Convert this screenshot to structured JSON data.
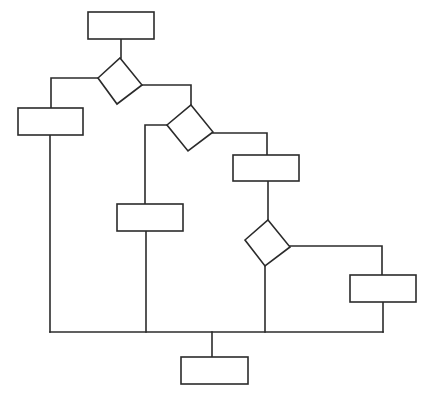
{
  "diagram": {
    "type": "flowchart",
    "background": "#ffffff",
    "stroke_color": "#2b2b2b",
    "nodes": [
      {
        "id": "start-process",
        "shape": "rect",
        "x": 88,
        "y": 12,
        "w": 66,
        "h": 27,
        "label": ""
      },
      {
        "id": "decision-1",
        "shape": "diamond",
        "points": [
          [
            120,
            58
          ],
          [
            142,
            85
          ],
          [
            117,
            104
          ],
          [
            98,
            78
          ]
        ],
        "label": ""
      },
      {
        "id": "process-left",
        "shape": "rect",
        "x": 18,
        "y": 108,
        "w": 65,
        "h": 27,
        "label": ""
      },
      {
        "id": "decision-2",
        "shape": "diamond",
        "points": [
          [
            191,
            105
          ],
          [
            213,
            132
          ],
          [
            188,
            151
          ],
          [
            167,
            125
          ]
        ],
        "label": ""
      },
      {
        "id": "process-middle",
        "shape": "rect",
        "x": 117,
        "y": 204,
        "w": 66,
        "h": 27,
        "label": ""
      },
      {
        "id": "process-right-upper",
        "shape": "rect",
        "x": 233,
        "y": 155,
        "w": 66,
        "h": 26,
        "label": ""
      },
      {
        "id": "decision-3",
        "shape": "diamond",
        "points": [
          [
            268,
            220
          ],
          [
            290,
            247
          ],
          [
            265,
            266
          ],
          [
            245,
            240
          ]
        ],
        "label": ""
      },
      {
        "id": "process-right",
        "shape": "rect",
        "x": 350,
        "y": 275,
        "w": 66,
        "h": 27,
        "label": ""
      },
      {
        "id": "end-process",
        "shape": "rect",
        "x": 181,
        "y": 357,
        "w": 67,
        "h": 27,
        "label": ""
      }
    ],
    "edges": [
      {
        "id": "start-to-decision-1",
        "points": [
          [
            121,
            39
          ],
          [
            121,
            58
          ]
        ]
      },
      {
        "id": "decision-1-to-left",
        "points": [
          [
            98,
            78
          ],
          [
            51,
            78
          ],
          [
            51,
            108
          ]
        ]
      },
      {
        "id": "decision-1-to-decision-2",
        "points": [
          [
            142,
            85
          ],
          [
            191,
            85
          ],
          [
            191,
            105
          ]
        ]
      },
      {
        "id": "decision-2-to-middle",
        "points": [
          [
            167,
            125
          ],
          [
            145,
            125
          ],
          [
            145,
            204
          ]
        ]
      },
      {
        "id": "decision-2-to-right-upper",
        "points": [
          [
            213,
            133
          ],
          [
            267,
            133
          ],
          [
            267,
            155
          ]
        ]
      },
      {
        "id": "right-upper-to-decision-3",
        "points": [
          [
            268,
            181
          ],
          [
            268,
            220
          ]
        ]
      },
      {
        "id": "decision-3-to-right",
        "points": [
          [
            290,
            246
          ],
          [
            382,
            246
          ],
          [
            382,
            275
          ]
        ]
      },
      {
        "id": "left-to-bus",
        "points": [
          [
            50,
            135
          ],
          [
            50,
            332
          ]
        ]
      },
      {
        "id": "middle-to-bus",
        "points": [
          [
            146,
            231
          ],
          [
            146,
            332
          ]
        ]
      },
      {
        "id": "decision-3-to-bus",
        "points": [
          [
            265,
            266
          ],
          [
            265,
            332
          ]
        ]
      },
      {
        "id": "right-to-bus",
        "points": [
          [
            383,
            302
          ],
          [
            383,
            332
          ]
        ]
      },
      {
        "id": "merge-bus",
        "points": [
          [
            50,
            332
          ],
          [
            383,
            332
          ]
        ]
      },
      {
        "id": "bus-to-end",
        "points": [
          [
            212,
            332
          ],
          [
            212,
            357
          ]
        ]
      }
    ]
  }
}
